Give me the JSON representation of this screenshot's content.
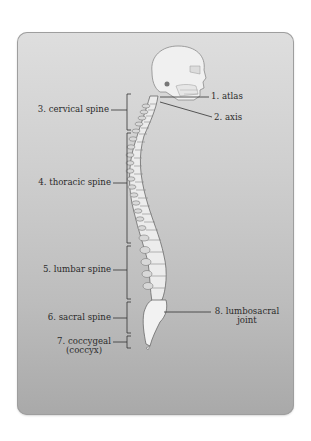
{
  "diagram": {
    "labels": {
      "atlas": "1. atlas",
      "axis": "2. axis",
      "cervical": "3. cervical spine",
      "thoracic": "4. thoracic spine",
      "lumbar": "5. lumbar spine",
      "sacral": "6. sacral spine",
      "coccygeal_line1": "7. coccygeal",
      "coccygeal_line2": "(coccyx)",
      "lumbosacral_line1": "8. lumbosacral",
      "lumbosacral_line2": "joint"
    },
    "colors": {
      "panel_top": "#dedede",
      "panel_bottom": "#a9a9a9",
      "text": "#2b2b2b",
      "bone": "#eeeeee",
      "bone_outline": "#6a6a6a",
      "leader_line": "#333333"
    }
  }
}
